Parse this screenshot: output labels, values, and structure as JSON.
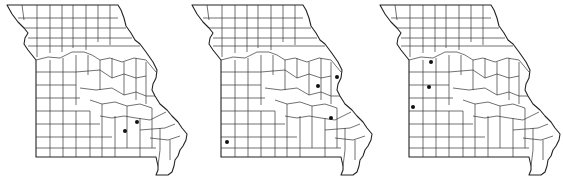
{
  "figure": {
    "maps": [
      {
        "id": "map-1",
        "offset_x": 0,
        "dots": [
          {
            "x": 125,
            "y": 131
          },
          {
            "x": 137,
            "y": 122
          }
        ]
      },
      {
        "id": "map-2",
        "offset_x": 185,
        "dots": [
          {
            "x": 42,
            "y": 142
          },
          {
            "x": 133,
            "y": 86
          },
          {
            "x": 146,
            "y": 118
          },
          {
            "x": 152,
            "y": 77
          }
        ]
      },
      {
        "id": "map-3",
        "offset_x": 373,
        "dots": [
          {
            "x": 58,
            "y": 62
          },
          {
            "x": 56,
            "y": 87
          },
          {
            "x": 40,
            "y": 107
          }
        ]
      }
    ],
    "colors": {
      "background": "#ffffff",
      "outline": "#222222",
      "county_lines": "#333333",
      "dot": "#111111"
    }
  }
}
